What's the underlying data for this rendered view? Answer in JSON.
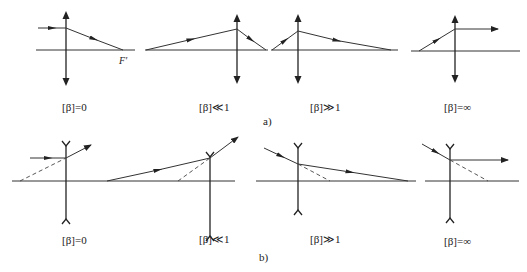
{
  "figure": {
    "part_a": {
      "caption": "a)",
      "lens_type": "converging",
      "panels": [
        {
          "label": "[β]=0",
          "focal_label": "F′"
        },
        {
          "label": "[β]≪1"
        },
        {
          "label": "[β]≫1"
        },
        {
          "label": "[β]=∞"
        }
      ]
    },
    "part_b": {
      "caption": "b)",
      "lens_type": "diverging",
      "panels": [
        {
          "label": "[β]=0"
        },
        {
          "label": "[β]≪1"
        },
        {
          "label": "[β]≫1"
        },
        {
          "label": "[β]=∞"
        }
      ]
    }
  }
}
